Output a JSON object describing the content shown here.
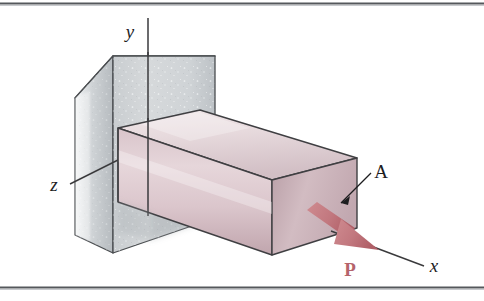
{
  "figure": {
    "kind": "engineering-diagram",
    "background_color": "#ffffff",
    "frame": {
      "top_rule_color": "#55585c",
      "bottom_rule_color": "#55585c",
      "rule_thickness": 2
    }
  },
  "axes": {
    "y": {
      "label": "y",
      "line_color": "#3a3a3c",
      "x": 148,
      "y_top": 18,
      "y_bottom": 216,
      "label_x": 133,
      "label_y": 36
    },
    "z": {
      "label": "z",
      "line_color": "#3a3a3c",
      "x_start": 152,
      "y_start": 143,
      "x_end": 70,
      "y_end": 184,
      "label_x": 52,
      "label_y": 190
    },
    "x": {
      "label": "x",
      "line_color": "#3a3a3c",
      "x_start": 331,
      "y_start": 231,
      "x_end": 424,
      "y_end": 266,
      "label_x": 432,
      "label_y": 272
    }
  },
  "wall": {
    "name": "support-wall",
    "fill_light": "#d5d8da",
    "fill_mid": "#c3c7ca",
    "fill_dark": "#aeb3b7",
    "fill_top": "#e2e4e6",
    "edge_color": "#4a4d50",
    "speckle_color": "#f4f6f7"
  },
  "bar": {
    "name": "axially-loaded-bar",
    "top_face_light": "#ece2e4",
    "top_face_dark": "#cfbcc2",
    "front_face_light": "#e3d2d7",
    "front_face_dark": "#c3a9b1",
    "end_face_light": "#d8c4ca",
    "end_face_dark": "#b99fa7",
    "edge_color": "#3f3f42"
  },
  "cross_section": {
    "label": "A",
    "label_x": 378,
    "label_y": 178,
    "leader_from_x": 371,
    "leader_from_y": 184,
    "leader_to_x": 340,
    "leader_to_y": 205,
    "leader_color": "#1d1d1f"
  },
  "force": {
    "label": "P",
    "color": "#b5646b",
    "shaft_color": "#c98086",
    "head_color": "#b5646b",
    "label_x": 349,
    "label_y": 272,
    "tail_x": 309,
    "tail_y": 214,
    "tip_x": 378,
    "tip_y": 251
  },
  "shadow": {
    "color": "#b0b5b8",
    "opacity": 0.55
  }
}
